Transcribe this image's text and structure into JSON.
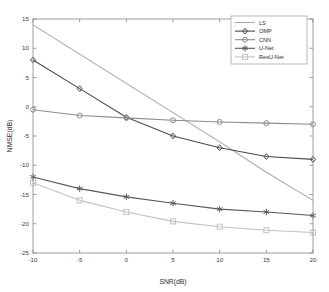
{
  "chart_data": {
    "type": "line",
    "title": "",
    "xlabel": "SNR(dB)",
    "ylabel": "NMSE(dB)",
    "x": [
      -10,
      -5,
      0,
      5,
      10,
      15,
      20
    ],
    "xlim": [
      -10,
      20
    ],
    "ylim": [
      -25,
      15
    ],
    "xticks": [
      "-10",
      "-5",
      "0",
      "5",
      "10",
      "15",
      "20"
    ],
    "yticks": [
      "15",
      "10",
      "5",
      "0",
      "-5",
      "-10",
      "-15",
      "-20",
      "-25"
    ],
    "xtick_values": [
      -10,
      -5,
      0,
      5,
      10,
      15,
      20
    ],
    "ytick_values": [
      15,
      10,
      5,
      0,
      -5,
      -10,
      -15,
      -20,
      -25
    ],
    "grid": false,
    "legend_position": "upper right",
    "series": [
      {
        "name": "LS",
        "values": [
          14.0,
          9.0,
          4.0,
          -1.0,
          -6.0,
          -11.2,
          -16.0
        ],
        "color": "#a8a8a8",
        "marker": "none"
      },
      {
        "name": "OMP",
        "values": [
          8.0,
          3.1,
          -1.8,
          -5.0,
          -7.0,
          -8.5,
          -9.0
        ],
        "color": "#4a4a4a",
        "marker": "diamond"
      },
      {
        "name": "CNN",
        "values": [
          -0.5,
          -1.5,
          -1.9,
          -2.3,
          -2.6,
          -2.8,
          -3.0
        ],
        "color": "#8d8d8d",
        "marker": "circle"
      },
      {
        "name": "U-Net",
        "values": [
          -12.0,
          -14.0,
          -15.4,
          -16.5,
          -17.5,
          -18.0,
          -18.6
        ],
        "color": "#595959",
        "marker": "star"
      },
      {
        "name": "ResU-Net",
        "values": [
          -13.0,
          -16.0,
          -18.0,
          -19.6,
          -20.5,
          -21.1,
          -21.5
        ],
        "color": "#c2c2c2",
        "marker": "square"
      }
    ]
  },
  "legend": {
    "entries": [
      {
        "label": "LS"
      },
      {
        "label": "OMP"
      },
      {
        "label": "CNN"
      },
      {
        "label": "U-Net"
      },
      {
        "label": "ResU-Net"
      }
    ]
  },
  "axes": {
    "box_color": "#888888"
  }
}
